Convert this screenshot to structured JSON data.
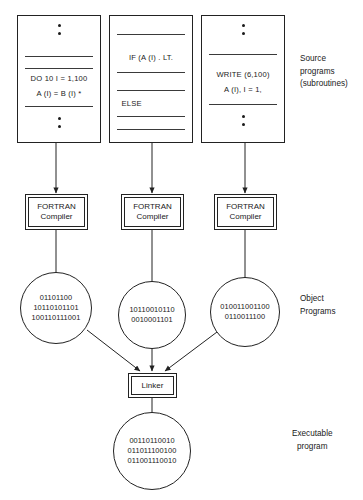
{
  "diagram": {
    "colors": {
      "stroke": "#222222",
      "background": "#ffffff",
      "text": "#1a1a1a"
    }
  },
  "source_programs": [
    {
      "name": "source-program-1",
      "lines": [
        "DO  10  I  =  1,100",
        "A (I)  =  B (I) *"
      ],
      "has_top_dots": true,
      "has_bottom_dots": true
    },
    {
      "name": "source-program-2",
      "lines": [
        "IF  (A (I) . LT.",
        "ELSE"
      ],
      "has_top_dots": false,
      "has_bottom_dots": false
    },
    {
      "name": "source-program-3",
      "lines": [
        "WRITE (6,100)",
        "A (I), I = 1,"
      ],
      "has_top_dots": true,
      "has_bottom_dots": true
    }
  ],
  "compilers": [
    {
      "line1": "FORTRAN",
      "line2": "Compiler"
    },
    {
      "line1": "FORTRAN",
      "line2": "Compiler"
    },
    {
      "line1": "FORTRAN",
      "line2": "Compiler"
    }
  ],
  "object_programs": [
    {
      "bits": [
        "01101100",
        "10110101101",
        "100110111001"
      ]
    },
    {
      "bits": [
        "10110010110",
        "0010001101"
      ]
    },
    {
      "bits": [
        "010011001100",
        "0110011100"
      ]
    }
  ],
  "linker": {
    "label": "Linker"
  },
  "executable": {
    "bits": [
      "00110110010",
      "011011100100",
      "011001110010"
    ]
  },
  "captions": {
    "source": [
      "Source",
      "programs",
      "(subroutines)"
    ],
    "object": [
      "Object",
      "Programs"
    ],
    "executable": [
      "Executable",
      "program"
    ]
  }
}
